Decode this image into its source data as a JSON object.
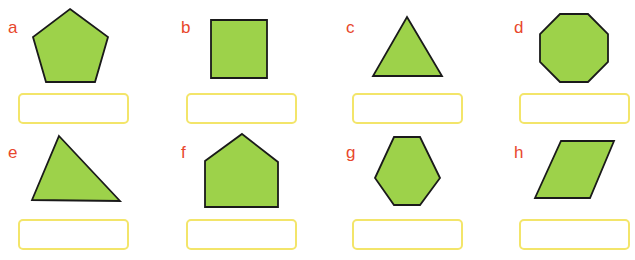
{
  "exercise": {
    "colors": {
      "label": "#e8472c",
      "shape_fill": "#9dd24a",
      "shape_stroke": "#1a1a1a",
      "box_border": "#f3e56a"
    },
    "items": [
      {
        "label": "a",
        "shape": "pentagon",
        "answer": ""
      },
      {
        "label": "b",
        "shape": "square",
        "answer": ""
      },
      {
        "label": "c",
        "shape": "equilateral-triangle",
        "answer": ""
      },
      {
        "label": "d",
        "shape": "octagon",
        "answer": ""
      },
      {
        "label": "e",
        "shape": "triangle",
        "answer": ""
      },
      {
        "label": "f",
        "shape": "pentagon",
        "answer": ""
      },
      {
        "label": "g",
        "shape": "hexagon",
        "answer": ""
      },
      {
        "label": "h",
        "shape": "parallelogram",
        "answer": ""
      }
    ]
  }
}
